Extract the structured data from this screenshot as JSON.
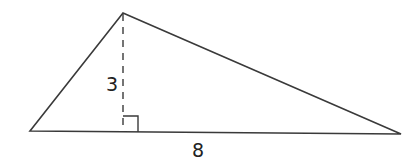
{
  "figure": {
    "type": "triangle",
    "labels": {
      "height": "3",
      "base": "8"
    },
    "colors": {
      "stroke": "#3a3a3a",
      "text": "#222222",
      "background": "#ffffff"
    },
    "marks": [
      "right-angle-mark",
      "dashed-altitude"
    ]
  }
}
